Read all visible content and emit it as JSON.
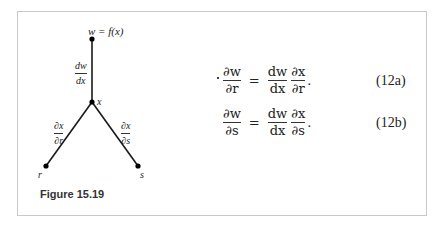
{
  "figure": {
    "caption": "Figure 15.19",
    "tree": {
      "top_label": "w = f(x)",
      "middle_label": "x",
      "left_label": "r",
      "right_label": "s",
      "edge_top": {
        "num": "dw",
        "den": "dx"
      },
      "edge_left": {
        "num": "∂x",
        "den": "∂r"
      },
      "edge_right": {
        "num": "∂x",
        "den": "∂s"
      }
    }
  },
  "equations": [
    {
      "lhs": {
        "num": "∂w",
        "den": "∂r"
      },
      "op": "=",
      "rhs1": {
        "num": "dw",
        "den": "dx"
      },
      "rhs2": {
        "num": "∂x",
        "den": "∂r"
      },
      "end": ".",
      "number": "(12a)"
    },
    {
      "lhs": {
        "num": "∂w",
        "den": "∂s"
      },
      "op": "=",
      "rhs1": {
        "num": "dw",
        "den": "dx"
      },
      "rhs2": {
        "num": "∂x",
        "den": "∂s"
      },
      "end": ".",
      "number": "(12b)"
    }
  ]
}
